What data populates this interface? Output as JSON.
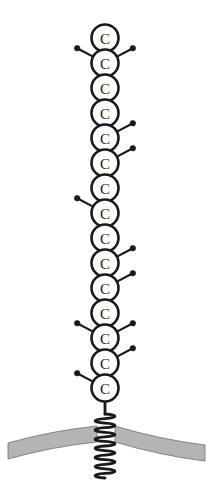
{
  "figure": {
    "background_color": "#ffffff",
    "width": 212,
    "height": 497
  },
  "chain": {
    "label": "Carbon backbone chain",
    "node_label": "C",
    "node_count": 15,
    "center_x": 105,
    "first_node_y": 38,
    "node_spacing": 25,
    "node_radius": 13.5,
    "outline_color": "#1a1a1a",
    "fill_color": "#ffffff",
    "nodes": [
      {
        "index": 1,
        "label": "C",
        "cy": 38,
        "branches": []
      },
      {
        "index": 2,
        "label": "C",
        "cy": 63,
        "branches": [
          "left",
          "right"
        ]
      },
      {
        "index": 3,
        "label": "C",
        "cy": 88,
        "branches": []
      },
      {
        "index": 4,
        "label": "C",
        "cy": 113,
        "branches": []
      },
      {
        "index": 5,
        "label": "C",
        "cy": 138,
        "branches": [
          "right"
        ]
      },
      {
        "index": 6,
        "label": "C",
        "cy": 163,
        "branches": [
          "right"
        ]
      },
      {
        "index": 7,
        "label": "C",
        "cy": 188,
        "branches": []
      },
      {
        "index": 8,
        "label": "C",
        "cy": 213,
        "branches": [
          "left"
        ]
      },
      {
        "index": 9,
        "label": "C",
        "cy": 238,
        "branches": []
      },
      {
        "index": 10,
        "label": "C",
        "cy": 263,
        "branches": [
          "right"
        ]
      },
      {
        "index": 11,
        "label": "C",
        "cy": 288,
        "branches": [
          "right"
        ]
      },
      {
        "index": 12,
        "label": "C",
        "cy": 313,
        "branches": []
      },
      {
        "index": 13,
        "label": "C",
        "cy": 338,
        "branches": [
          "left",
          "right"
        ]
      },
      {
        "index": 14,
        "label": "C",
        "cy": 363,
        "branches": [
          "right"
        ]
      },
      {
        "index": 15,
        "label": "C",
        "cy": 388,
        "branches": [
          "left"
        ]
      }
    ]
  },
  "branch": {
    "label": "Side group with terminal dot",
    "stem_length": 18,
    "angle_degrees": 28,
    "dot_radius": 2.8,
    "color": "#1a1a1a"
  },
  "tail": {
    "label": "Helical membrane anchor",
    "stem_top_y": 401,
    "stem_bottom_y": 414,
    "helix_top_y": 414,
    "helix_bottom_y": 478,
    "helix_turns": 7,
    "helix_amplitude": 7,
    "center_x": 105,
    "color": "#1a1a1a"
  },
  "membrane": {
    "label": "Lipid membrane bilayer band",
    "fill_color": "#b4b4b4",
    "edge_color": "#6e6e6e",
    "thickness": 16,
    "gap_left_x": 97,
    "gap_right_x": 115,
    "left_segment": {
      "start_x": 8,
      "start_y": 443,
      "end_x": 97,
      "end_y": 426
    },
    "right_segment": {
      "start_x": 115,
      "start_y": 426,
      "end_x": 205,
      "end_y": 445
    }
  }
}
